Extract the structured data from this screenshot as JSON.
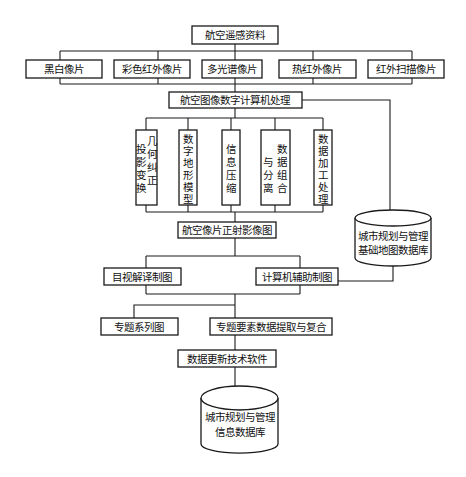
{
  "diagram": {
    "title_node": {
      "label": "航空遥感资料"
    },
    "photo_types": [
      {
        "label": "黑白像片"
      },
      {
        "label": "彩色红外像片"
      },
      {
        "label": "多光谱像片"
      },
      {
        "label": "热红外像片"
      },
      {
        "label": "红外扫描像片"
      }
    ],
    "processing": {
      "label": "航空图像数字计算机处理"
    },
    "processing_steps": [
      {
        "label": "几何投影变换纠正",
        "col1": [
          "投",
          "影",
          "变",
          "换"
        ],
        "col2": [
          "几",
          "何",
          "纠",
          "正"
        ]
      },
      {
        "label": "数字地形模型",
        "chars": [
          "数",
          "字",
          "地",
          "形",
          "模",
          "型"
        ]
      },
      {
        "label": "信息压缩",
        "chars": [
          "信",
          "息",
          "压",
          "缩"
        ]
      },
      {
        "label": "数据组合与分离",
        "col1": [
          "与",
          "分",
          "离"
        ],
        "col2": [
          "数",
          "据",
          "组",
          "合"
        ]
      },
      {
        "label": "数据加工处理",
        "chars": [
          "数",
          "据",
          "加",
          "工",
          "处",
          "理"
        ]
      }
    ],
    "orthophoto": {
      "label": "航空像片正射影像图"
    },
    "base_db": {
      "line1": "城市规划与管理",
      "line2": "基础地图数据库"
    },
    "mapping": [
      {
        "label": "目视解译制图"
      },
      {
        "label": "计算机辅助制图"
      }
    ],
    "thematic": [
      {
        "label": "专题系列图"
      },
      {
        "label": "专题要素数据提取与复合"
      }
    ],
    "update_software": {
      "label": "数据更新技术软件"
    },
    "info_db": {
      "line1": "城市规划与管理",
      "line2": "信息数据库"
    }
  }
}
